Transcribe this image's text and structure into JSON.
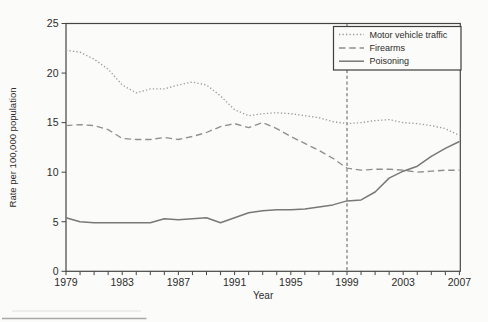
{
  "page": {
    "background": "#fbfbf9"
  },
  "chart_data": {
    "type": "line",
    "title": "",
    "xlabel": "Year",
    "ylabel": "Rate per 100,000 population",
    "x": [
      1979,
      1980,
      1981,
      1982,
      1983,
      1984,
      1985,
      1986,
      1987,
      1988,
      1989,
      1990,
      1991,
      1992,
      1993,
      1994,
      1995,
      1996,
      1997,
      1998,
      1999,
      2000,
      2001,
      2002,
      2003,
      2004,
      2005,
      2006,
      2007
    ],
    "x_tick_labels": [
      "1979",
      "1983",
      "1987",
      "1991",
      "1995",
      "1999",
      "2003",
      "2007"
    ],
    "x_tick_years": [
      1979,
      1983,
      1987,
      1991,
      1995,
      1999,
      2003,
      2007
    ],
    "y_ticks": [
      0,
      5,
      10,
      15,
      20,
      25
    ],
    "ylim": [
      0,
      25
    ],
    "xlim": [
      1979,
      2007
    ],
    "grid": false,
    "legend_position": "top-right",
    "reference_line": {
      "x": 1999,
      "orientation": "vertical",
      "style": "dashed",
      "color": "#5a5a5a"
    },
    "series": [
      {
        "name": "Motor vehicle traffic",
        "line_style": "dotted",
        "color": "#9c9c9c",
        "values": [
          22.3,
          22.1,
          21.4,
          20.4,
          18.8,
          18.0,
          18.4,
          18.4,
          18.8,
          19.1,
          18.8,
          17.7,
          16.3,
          15.7,
          15.9,
          16.0,
          15.9,
          15.7,
          15.5,
          15.1,
          14.9,
          15.0,
          15.2,
          15.3,
          15.0,
          14.9,
          14.7,
          14.4,
          13.7
        ]
      },
      {
        "name": "Firearms",
        "line_style": "dashed",
        "color": "#8f8f8f",
        "values": [
          14.7,
          14.8,
          14.7,
          14.3,
          13.4,
          13.3,
          13.3,
          13.5,
          13.3,
          13.6,
          14.0,
          14.6,
          14.9,
          14.5,
          15.0,
          14.4,
          13.6,
          12.9,
          12.2,
          11.4,
          10.4,
          10.2,
          10.3,
          10.3,
          10.2,
          10.0,
          10.1,
          10.2,
          10.2
        ]
      },
      {
        "name": "Poisoning",
        "line_style": "solid",
        "color": "#787878",
        "values": [
          5.4,
          5.0,
          4.9,
          4.9,
          4.9,
          4.9,
          4.9,
          5.3,
          5.2,
          5.3,
          5.4,
          4.9,
          5.4,
          5.9,
          6.1,
          6.2,
          6.2,
          6.3,
          6.5,
          6.7,
          7.1,
          7.2,
          8.0,
          9.4,
          10.1,
          10.6,
          11.6,
          12.4,
          13.1
        ]
      }
    ]
  },
  "axis_color": "#454545",
  "footnote_rule": {
    "present": true,
    "color": "#a8a8a8"
  }
}
